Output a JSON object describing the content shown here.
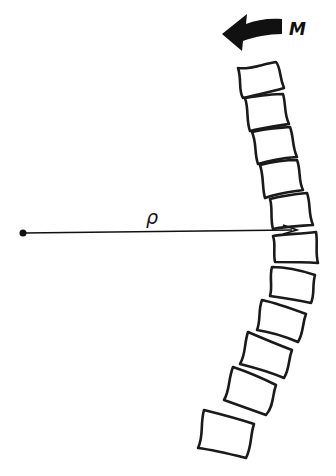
{
  "diagram": {
    "labels": {
      "moment": "M",
      "radius": "ρ"
    },
    "elements": [
      {
        "type": "moment-arrow",
        "direction": "counterclockwise",
        "label": "M"
      },
      {
        "type": "radius-vector",
        "label": "ρ",
        "from": "center-of-curvature",
        "to": "spine"
      },
      {
        "type": "vertebra-stack",
        "count": 12,
        "curve": "convex-right"
      }
    ],
    "colors": {
      "ink": "#1a1a1a",
      "background": "#ffffff"
    }
  }
}
